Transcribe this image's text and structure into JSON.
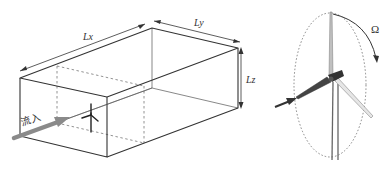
{
  "diagram": {
    "type": "wind-turbine-computational-domain",
    "domain_box": {
      "labels": {
        "length_x": "Lx",
        "length_y": "Ly",
        "height": "Lz"
      },
      "inflow_label": "流入"
    },
    "rotor": {
      "rotation_label": "Ω"
    },
    "colors": {
      "line": "#333333",
      "dashed": "#777777",
      "arrow": "#7a7a7a",
      "blade_light": "#c8c8c8",
      "tower": "#555555"
    }
  }
}
